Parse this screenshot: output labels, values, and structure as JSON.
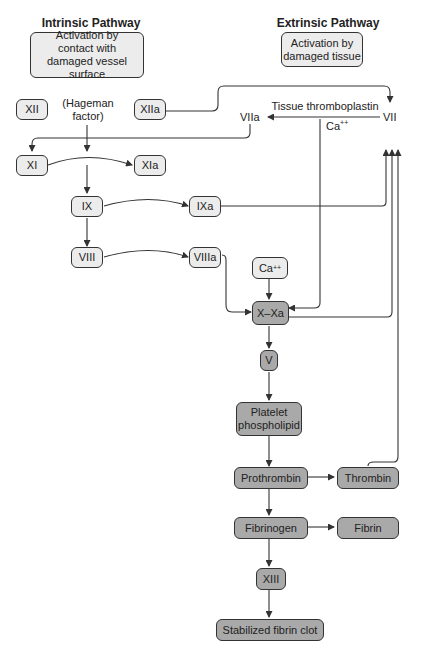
{
  "headers": {
    "intrinsic": "Intrinsic Pathway",
    "extrinsic": "Extrinsic Pathway"
  },
  "triggers": {
    "intrinsic": "Activation by contact with damaged vessel surface",
    "extrinsic": "Activation by damaged tissue"
  },
  "factors": {
    "xii": "XII",
    "hageman": "(Hageman factor)",
    "xiia": "XIIa",
    "tissue_thromboplastin": "Tissue thromboplastin",
    "viia": "VIIa",
    "vii": "VII",
    "ca_top_base": "Ca",
    "ca_top_sup": "++",
    "xi": "XI",
    "xia": "XIa",
    "ix": "IX",
    "ixa": "IXa",
    "viii": "VIII",
    "viiia": "VIIIa",
    "ca_box_base": "Ca",
    "ca_box_sup": "++",
    "x_xa": "X–Xa",
    "v": "V",
    "platelet": "Platelet phospholipid",
    "prothrombin": "Prothrombin",
    "thrombin": "Thrombin",
    "fibrinogen": "Fibrinogen",
    "fibrin": "Fibrin",
    "xiii": "XIII",
    "clot": "Stabilized fibrin clot"
  },
  "colors": {
    "light_box": "#ececec",
    "dark_box": "#a9a9a9",
    "line": "#333333"
  }
}
